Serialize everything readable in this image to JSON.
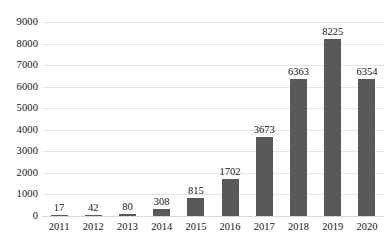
{
  "chart_data": {
    "type": "bar",
    "title": "",
    "subtitle": "",
    "xlabel": "",
    "ylabel": "",
    "categories": [
      "2011",
      "2012",
      "2013",
      "2014",
      "2015",
      "2016",
      "2017",
      "2018",
      "2019",
      "2020"
    ],
    "values": [
      17,
      42,
      80,
      308,
      815,
      1702,
      3673,
      6363,
      8225,
      6354
    ],
    "data_labels": [
      "17",
      "42",
      "80",
      "308",
      "815",
      "1702",
      "3673",
      "6363",
      "8225",
      "6354"
    ],
    "ylim": [
      0,
      9000
    ],
    "ytick_step": 1000,
    "ytick_labels": [
      "9000",
      "8000",
      "7000",
      "6000",
      "5000",
      "4000",
      "3000",
      "2000",
      "1000",
      "0"
    ],
    "ytick_values": [
      9000,
      8000,
      7000,
      6000,
      5000,
      4000,
      3000,
      2000,
      1000,
      0
    ],
    "grid": "horizontal",
    "legend": "none",
    "legend_entries": [],
    "annotations": [],
    "colors": {
      "bar": "#595959",
      "gridline": "#e6e6e6",
      "baseline": "#d9d9d9",
      "text": "#151515",
      "background": "#ffffff"
    }
  }
}
